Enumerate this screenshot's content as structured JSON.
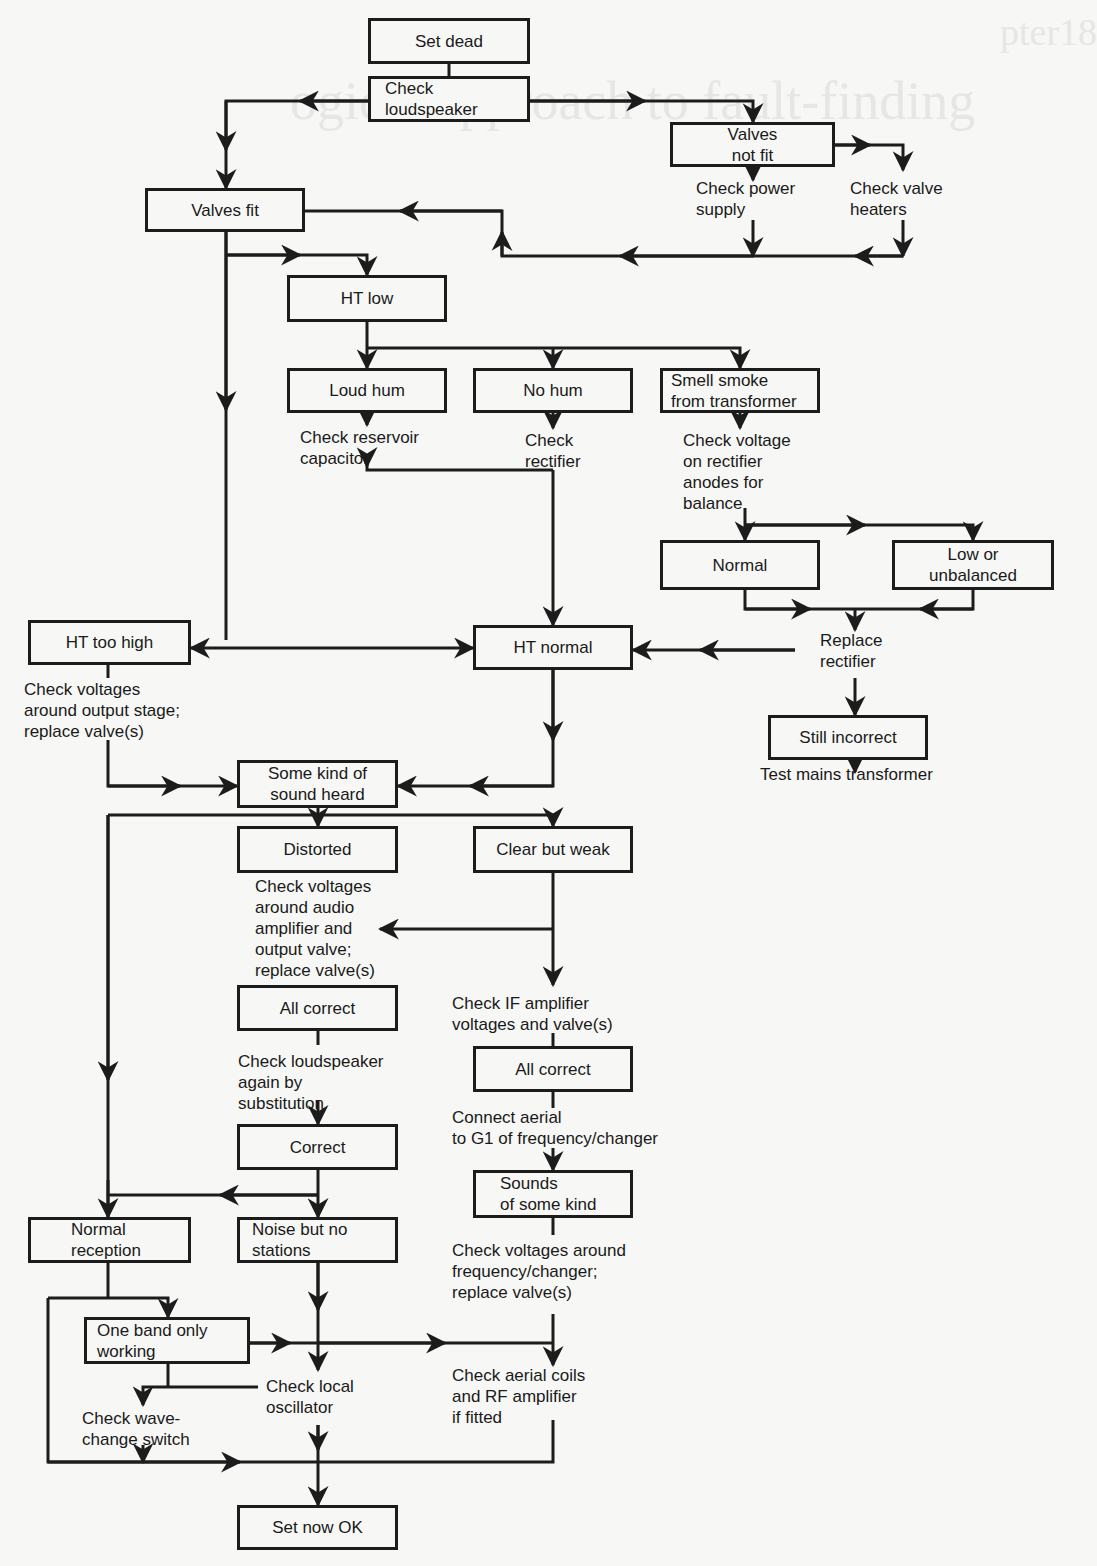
{
  "background_bleed": {
    "header_fragment": "pter18",
    "title_fragment": "ogical approach to fault-finding"
  },
  "diagram": {
    "type": "flowchart",
    "title": "",
    "boxes": {
      "set_dead": "Set dead",
      "check_loudspeaker": "Check\nloudspeaker",
      "valves_not_fit": "Valves\nnot fit",
      "valves_fit": "Valves fit",
      "ht_low": "HT low",
      "loud_hum": "Loud hum",
      "no_hum": "No hum",
      "smell_smoke": "Smell smoke\nfrom transformer",
      "normal": "Normal",
      "low_or_unbalanced": "Low or\nunbalanced",
      "ht_too_high": "HT too high",
      "ht_normal": "HT normal",
      "still_incorrect": "Still incorrect",
      "some_kind_of_sound": "Some kind of\nsound heard",
      "distorted": "Distorted",
      "clear_but_weak": "Clear but weak",
      "all_correct_left": "All correct",
      "all_correct_right": "All correct",
      "correct": "Correct",
      "sounds_of_some_kind": "Sounds\nof some kind",
      "normal_reception": "Normal\nreception",
      "noise_but_no_stations": "Noise but no\nstations",
      "one_band_only": "One band only\nworking",
      "set_now_ok": "Set now OK"
    },
    "notes": {
      "check_power_supply": "Check power\nsupply",
      "check_valve_heaters": "Check valve\nheaters",
      "check_reservoir": "Check reservoir\ncapacitor",
      "check_rectifier": "Check\nrectifier",
      "check_voltage_anodes": "Check voltage\non rectifier\nanodes for\nbalance",
      "replace_rectifier": "Replace\nrectifier",
      "test_mains": "Test mains transformer",
      "check_output_stage": "Check voltages\naround output stage;\nreplace valve(s)",
      "check_audio_amp": "Check voltages\naround audio\namplifier and\noutput valve;\nreplace valve(s)",
      "check_if_amp": "Check IF amplifier\nvoltages and valve(s)",
      "check_loudspeaker_again": "Check loudspeaker\nagain by\nsubstitution",
      "connect_aerial": "Connect aerial\nto G1 of frequency/changer",
      "check_freq_changer": "Check voltages around\nfrequency/changer;\nreplace valve(s)",
      "check_local_osc": "Check local\noscillator",
      "check_aerial_coils": "Check aerial coils\nand RF amplifier\nif fitted",
      "check_wavechange": "Check wave-\nchange switch"
    },
    "colors": {
      "line": "#1c1c1c",
      "paper": "#f7f7f5",
      "bleed": "#e6e6e4"
    }
  }
}
